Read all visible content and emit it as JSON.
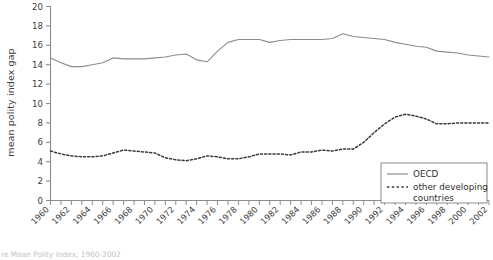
{
  "figure": {
    "caption": "re Mean Polity Index, 1960-2002"
  },
  "axes": {
    "ylabel": "mean polity index gap",
    "xlabel": ""
  },
  "legend": {
    "position": "bottom-right",
    "items": [
      {
        "label": "OECD",
        "style": "solid",
        "name": "legend-item-oecd"
      },
      {
        "label": "other developing",
        "label2": "countries",
        "style": "dashed",
        "name": "legend-item-other-developing-countries"
      }
    ]
  },
  "colors": {
    "oecd_line": "#8c8c8c",
    "other_line": "#3a3a3a",
    "axis": "#8d8d8d",
    "text": "#3d3d3d",
    "background": "#ffffff"
  },
  "chart_data": {
    "type": "line",
    "title": "",
    "xlabel": "",
    "ylabel": "mean polity index gap",
    "xlim": [
      1960,
      2002
    ],
    "ylim": [
      0,
      20
    ],
    "yticks": [
      0,
      2,
      4,
      6,
      8,
      10,
      12,
      14,
      16,
      18,
      20
    ],
    "xticks": [
      1960,
      1962,
      1964,
      1966,
      1968,
      1970,
      1972,
      1974,
      1976,
      1978,
      1980,
      1982,
      1984,
      1986,
      1988,
      1990,
      1992,
      1994,
      1996,
      1998,
      2000,
      2002
    ],
    "grid": false,
    "legend_position": "bottom-right",
    "x": [
      1960,
      1961,
      1962,
      1963,
      1964,
      1965,
      1966,
      1967,
      1968,
      1969,
      1970,
      1971,
      1972,
      1973,
      1974,
      1975,
      1976,
      1977,
      1978,
      1979,
      1980,
      1981,
      1982,
      1983,
      1984,
      1985,
      1986,
      1987,
      1988,
      1989,
      1990,
      1991,
      1992,
      1993,
      1994,
      1995,
      1996,
      1997,
      1998,
      1999,
      2000,
      2001,
      2002
    ],
    "series": [
      {
        "name": "OECD",
        "style": "solid",
        "color": "#8c8c8c",
        "values": [
          14.7,
          14.2,
          13.8,
          13.8,
          14.0,
          14.2,
          14.7,
          14.6,
          14.6,
          14.6,
          14.7,
          14.8,
          15.0,
          15.1,
          14.5,
          14.3,
          15.4,
          16.3,
          16.6,
          16.6,
          16.6,
          16.3,
          16.5,
          16.6,
          16.6,
          16.6,
          16.6,
          16.7,
          17.2,
          16.9,
          16.8,
          16.7,
          16.6,
          16.3,
          16.1,
          15.9,
          15.8,
          15.4,
          15.3,
          15.2,
          15.0,
          14.9,
          14.8
        ]
      },
      {
        "name": "other developing countries",
        "style": "dashed",
        "color": "#3a3a3a",
        "values": [
          5.1,
          4.8,
          4.6,
          4.5,
          4.5,
          4.6,
          4.9,
          5.2,
          5.1,
          5.0,
          4.9,
          4.4,
          4.2,
          4.1,
          4.3,
          4.6,
          4.5,
          4.3,
          4.3,
          4.5,
          4.8,
          4.8,
          4.8,
          4.7,
          5.0,
          5.0,
          5.2,
          5.1,
          5.3,
          5.3,
          6.0,
          7.0,
          7.9,
          8.6,
          8.9,
          8.7,
          8.4,
          7.9,
          7.9,
          8.0,
          8.0,
          8.0,
          8.0
        ]
      }
    ]
  }
}
